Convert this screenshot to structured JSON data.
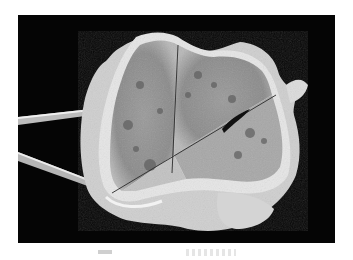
{
  "figure": {
    "type": "gross-pathology-photograph",
    "background_color": "#050505",
    "specimen_color": "#bdbdbd",
    "cortex_color": "#e8e8e8",
    "tool": "forceps",
    "caption_visible_text": ""
  }
}
